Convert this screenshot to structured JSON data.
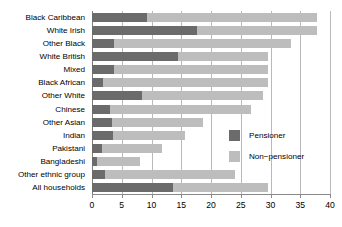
{
  "chart_data": {
    "type": "bar",
    "orientation": "horizontal",
    "stacked": true,
    "title": "",
    "xlabel": "",
    "ylabel": "",
    "xlim": [
      0,
      40
    ],
    "xticks": [
      0,
      5,
      10,
      15,
      20,
      25,
      30,
      35,
      40
    ],
    "grid": true,
    "grid_axis": "x",
    "legend_position": "right-inside",
    "categories": [
      "Black Caribbean",
      "White Irish",
      "Other Black",
      "White British",
      "Mixed",
      "Black African",
      "Other White",
      "Chinese",
      "Other Asian",
      "Indian",
      "Pakistani",
      "Bangladeshi",
      "Other ethnic group",
      "All households"
    ],
    "series": [
      {
        "name": "Pensioner",
        "color": "#6b6b6b",
        "values": [
          9.2,
          17.6,
          3.7,
          14.5,
          3.7,
          1.9,
          8.4,
          3.0,
          3.3,
          3.5,
          1.7,
          0.8,
          2.2,
          13.6
        ]
      },
      {
        "name": "Non-pensioner",
        "color": "#bdbdbd",
        "values": [
          28.6,
          20.2,
          29.7,
          15.1,
          25.9,
          27.7,
          20.3,
          23.8,
          15.4,
          12.1,
          10.0,
          7.3,
          21.8,
          16.0
        ]
      }
    ],
    "totals": [
      37.8,
      37.8,
      33.4,
      29.6,
      29.6,
      29.6,
      28.7,
      26.8,
      18.7,
      15.6,
      11.7,
      8.1,
      24.0,
      29.6
    ]
  },
  "legend": {
    "items": [
      {
        "label": "Pensioner",
        "swatch_name": "legend-swatch-pensioner"
      },
      {
        "label": "Non−pensioner",
        "swatch_name": "legend-swatch-non-pensioner"
      }
    ]
  },
  "colors": {
    "pensioner": "#6b6b6b",
    "non_pensioner": "#bdbdbd",
    "gridline": "#b9b9b9",
    "axis": "#8a8a8a",
    "background": "#ffffff",
    "text": "#000000"
  }
}
